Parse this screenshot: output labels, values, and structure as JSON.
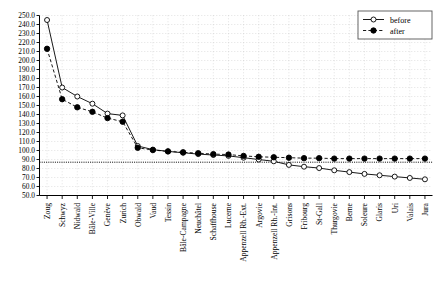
{
  "chart_data": {
    "type": "line",
    "title": "",
    "xlabel": "",
    "ylabel": "",
    "ylim": [
      50,
      250
    ],
    "ytick_step": 10,
    "grid": true,
    "legend_position": "top-right",
    "categories": [
      "Zoug",
      "Schwyz",
      "Nidwald",
      "Bâle-Ville",
      "Genève",
      "Zurich",
      "Obwald",
      "Vaud",
      "Tessin",
      "Bâle-Campagne",
      "Neuchâtel",
      "Schaffhouse",
      "Lucerne",
      "Appenzell Rh.-Ext.",
      "Argovie",
      "Appenzell Rh.-Int.",
      "Grisons",
      "Fribourg",
      "St-Gall",
      "Thurgovie",
      "Berne",
      "Soleure",
      "Glaris",
      "Uri",
      "Valais",
      "Jura"
    ],
    "series": [
      {
        "name": "before",
        "marker": "open-circle",
        "linestyle": "solid",
        "values": [
          245.0,
          170.0,
          160.0,
          152.0,
          141.0,
          139.0,
          105.0,
          101.0,
          99.0,
          97.5,
          96.0,
          95.0,
          94.0,
          92.0,
          90.0,
          88.0,
          84.0,
          82.0,
          80.5,
          78.0,
          76.0,
          74.0,
          72.5,
          71.0,
          69.5,
          68.0
        ]
      },
      {
        "name": "after",
        "marker": "filled-circle",
        "linestyle": "dashed",
        "values": [
          213.0,
          157.0,
          148.0,
          143.0,
          136.0,
          132.0,
          103.0,
          100.5,
          99.0,
          98.0,
          97.0,
          96.0,
          95.5,
          94.0,
          93.0,
          92.5,
          92.0,
          91.5,
          91.5,
          91.0,
          91.0,
          91.0,
          91.0,
          91.0,
          91.0,
          91.0
        ]
      }
    ],
    "reference_line": {
      "value": 87.0,
      "style": "dotted"
    },
    "ytick_labels": [
      "250.0",
      "240.0",
      "230.0",
      "220.0",
      "210.0",
      "200.0",
      "190.0",
      "180.0",
      "170.0",
      "160.0",
      "150.0",
      "140.0",
      "130.0",
      "120.0",
      "110.0",
      "100.0",
      "90.0",
      "80.0",
      "70.0",
      "60.0",
      "50.0"
    ]
  },
  "legend": {
    "entries": [
      {
        "label": "before"
      },
      {
        "label": "after"
      }
    ]
  }
}
